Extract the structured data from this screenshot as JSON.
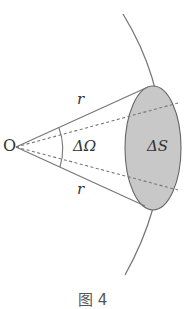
{
  "figure": {
    "labels": {
      "origin": "O",
      "radius_top": "r",
      "radius_bottom": "r",
      "solid_angle": "ΔΩ",
      "area": "ΔS"
    },
    "caption": "图 4"
  },
  "colors": {
    "line": "#777777",
    "ellipse_fill": "#c8c8c8",
    "ellipse_stroke": "#666666",
    "dashed": "#777777",
    "text": "#333333"
  }
}
